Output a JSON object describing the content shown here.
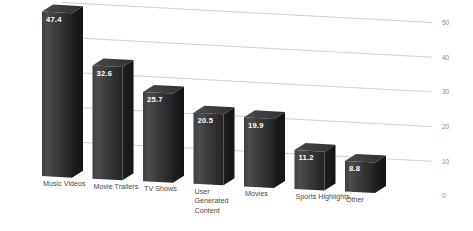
{
  "chart_data": {
    "type": "bar",
    "title": "",
    "subtitle": "",
    "xlabel": "",
    "ylabel": "",
    "categories": [
      "Music Videos",
      "Movie Trailers",
      "TV Shows",
      "User Generated Content",
      "Movies",
      "Sports Highlights",
      "Other"
    ],
    "category_lines": [
      [
        "Music Videos"
      ],
      [
        "Movie Trailers"
      ],
      [
        "TV Shows"
      ],
      [
        "User",
        "Generated",
        "Content"
      ],
      [
        "Movies"
      ],
      [
        "Sports Highlights"
      ],
      [
        "Other"
      ]
    ],
    "values": [
      47.4,
      32.6,
      25.7,
      20.5,
      19.9,
      11.2,
      8.8
    ],
    "value_labels": [
      "47.4",
      "32.6",
      "25.7",
      "20.5",
      "19.9",
      "11.2",
      "8.8"
    ],
    "ylim": [
      0,
      50
    ],
    "yticks": [
      50,
      40,
      30,
      20,
      10,
      0
    ],
    "ytick_labels": [
      "50",
      "40",
      "30",
      "20",
      "10",
      "0"
    ],
    "grid": true,
    "grid_axis": "y",
    "axis_position": "right",
    "legend": false,
    "legend_position": "none",
    "perspective_3d": true
  },
  "style": {
    "background": "#ffffff",
    "gridline_color": "#c9c9c9",
    "tick_label_color": "#8a8a8a",
    "category_label_color": "#4a4a4a",
    "value_label_color": "#ffffff",
    "bar_front_light": "#4a4a4c",
    "bar_front_dark": "#262628",
    "bar_side": "#1a1a1c",
    "bar_top": "#3c3c3e"
  }
}
